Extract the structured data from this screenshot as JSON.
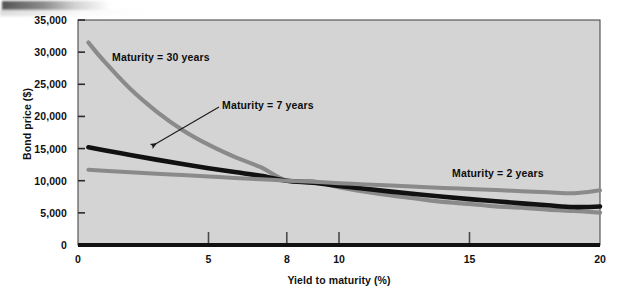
{
  "figure": {
    "name": "bond-price-vs-yield-chart",
    "plot_background": "#d4d4d4",
    "page_background": "#ffffff"
  },
  "chart_data": {
    "type": "line",
    "title": "",
    "xlabel": "Yield to maturity (%)",
    "ylabel": "Bond price ($)",
    "xlim": [
      0,
      20
    ],
    "ylim": [
      0,
      35000
    ],
    "xticks": [
      0,
      5,
      8,
      10,
      15,
      20
    ],
    "xticklabels": [
      "0",
      "5",
      "8",
      "10",
      "15",
      "20"
    ],
    "yticks": [
      0,
      5000,
      10000,
      15000,
      20000,
      25000,
      30000,
      35000
    ],
    "yticklabels": [
      "0",
      "5,000",
      "10,000",
      "15,000",
      "20,000",
      "25,000",
      "30,000",
      "35,000"
    ],
    "grid": false,
    "legend_position": "inline-annotations",
    "common_crossing_point": {
      "x": 8,
      "y": 10000
    },
    "series": [
      {
        "name": "Maturity = 30 years",
        "label": "Maturity = 30 years",
        "color": "#8a8a8a",
        "width": 4.2,
        "x": [
          0.4,
          1,
          2,
          3,
          4,
          5,
          6,
          7,
          8,
          9,
          10,
          11,
          12,
          13,
          14,
          15,
          16,
          17,
          18,
          19,
          20
        ],
        "values": [
          31500,
          28600,
          24300,
          20800,
          17900,
          15600,
          13700,
          12100,
          10000,
          9900,
          9000,
          8300,
          7700,
          7200,
          6700,
          6400,
          6000,
          5800,
          5500,
          5300,
          5050
        ]
      },
      {
        "name": "Maturity = 7 years",
        "label": "Maturity = 7 years",
        "color": "#111111",
        "width": 4.6,
        "x": [
          0.4,
          1,
          2,
          3,
          4,
          5,
          6,
          7,
          8,
          9,
          10,
          11,
          12,
          13,
          14,
          15,
          16,
          17,
          18,
          19,
          20
        ],
        "values": [
          15200,
          14750,
          14000,
          13280,
          12600,
          11950,
          11340,
          10760,
          10000,
          9690,
          9200,
          8740,
          8300,
          7890,
          7500,
          7140,
          6800,
          6480,
          6180,
          5900,
          5980
        ]
      },
      {
        "name": "Maturity = 2 years",
        "label": "Maturity = 2 years",
        "color": "#8a8a8a",
        "width": 4.0,
        "x": [
          0.4,
          1,
          2,
          3,
          4,
          5,
          6,
          7,
          8,
          9,
          10,
          11,
          12,
          13,
          14,
          15,
          16,
          17,
          18,
          19,
          20
        ],
        "values": [
          11700,
          11560,
          11330,
          11100,
          10880,
          10660,
          10440,
          10230,
          10000,
          9820,
          9620,
          9430,
          9240,
          9060,
          8880,
          8710,
          8540,
          8370,
          8210,
          8050,
          8500
        ]
      }
    ],
    "annotations": [
      {
        "text": "Maturity = 30 years",
        "target_series": "Maturity = 30 years",
        "has_leader": false
      },
      {
        "text": "Maturity = 7 years",
        "target_series": "Maturity = 7 years",
        "has_leader": true,
        "leader": "arrow pointing down-left to black curve"
      },
      {
        "text": "Maturity = 2 years",
        "target_series": "Maturity = 2 years",
        "has_leader": false
      }
    ]
  },
  "axes": {
    "y_title": "Bond price ($)",
    "x_title": "Yield to maturity (%)",
    "y_labels": [
      "35,000",
      "30,000",
      "25,000",
      "20,000",
      "15,000",
      "10,000",
      "5,000",
      "0"
    ],
    "x_labels": [
      "0",
      "5",
      "8",
      "10",
      "15",
      "20"
    ]
  },
  "labels": {
    "m30": "Maturity = 30 years",
    "m7": "Maturity = 7 years",
    "m2": "Maturity = 2 years"
  }
}
